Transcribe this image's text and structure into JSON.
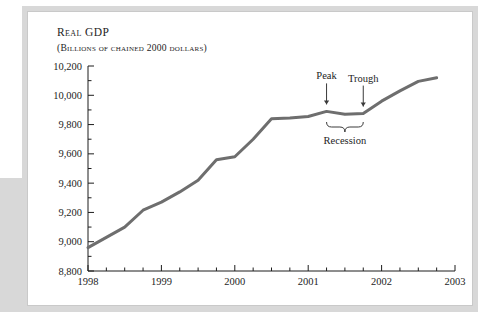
{
  "figure": {
    "title": "Real GDP",
    "subtitle": "(Billions of chained 2000 dollars)"
  },
  "chart_data": {
    "type": "line",
    "title": "Real GDP",
    "subtitle": "(Billions of chained 2000 dollars)",
    "xlabel": "",
    "ylabel": "Billions of chained 2000 dollars",
    "xlim": [
      1998.0,
      2003.0
    ],
    "ylim": [
      8800,
      10200
    ],
    "yticks": [
      8800,
      9000,
      9200,
      9400,
      9600,
      9800,
      10000,
      10200
    ],
    "ytick_labels": [
      "8,800",
      "9,000",
      "9,200",
      "9,400",
      "9,600",
      "9,800",
      "10,000",
      "10,200"
    ],
    "xticks": [
      1998,
      1999,
      2000,
      2001,
      2002,
      2003
    ],
    "xtick_labels": [
      "1998",
      "1999",
      "2000",
      "2001",
      "2002",
      "2003"
    ],
    "minor_ticks_per_interval": 4,
    "grid": false,
    "legend": null,
    "line_color": "#6e6e6e",
    "line_width": 3,
    "x": [
      1998.0,
      1998.25,
      1998.5,
      1998.75,
      1999.0,
      1999.25,
      1999.5,
      1999.75,
      2000.0,
      2000.25,
      2000.5,
      2000.75,
      2001.0,
      2001.25,
      2001.5,
      2001.75,
      2002.0,
      2002.25,
      2002.5,
      2002.75
    ],
    "values": [
      8960,
      9030,
      9100,
      9215,
      9270,
      9340,
      9420,
      9560,
      9580,
      9700,
      9840,
      9845,
      9855,
      9890,
      9870,
      9875,
      9960,
      10030,
      10095,
      10120
    ],
    "annotations": [
      {
        "label": "Peak",
        "x": 2001.25,
        "value": 9890,
        "type": "arrow-down"
      },
      {
        "label": "Trough",
        "x": 2001.75,
        "value": 9875,
        "type": "arrow-down"
      },
      {
        "label": "Recession",
        "x_start": 2001.25,
        "x_end": 2001.75,
        "type": "brace-below"
      }
    ]
  }
}
